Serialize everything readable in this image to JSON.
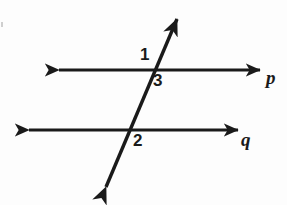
{
  "figure": {
    "background_color": "#fdfdfd",
    "stroke_color": "#1a1a1a",
    "stroke_width": 3,
    "width": 287,
    "height": 205
  },
  "lines": {
    "p": {
      "name": "p",
      "label": "p",
      "label_x": 266,
      "label_y": 68,
      "orientation": "horizontal",
      "y": 70,
      "x_start": 57,
      "x_end": 262,
      "arrows": "both"
    },
    "q": {
      "name": "q",
      "label": "q",
      "label_x": 241,
      "label_y": 130,
      "orientation": "horizontal",
      "y": 130,
      "x_start": 27,
      "x_end": 240,
      "arrows": "both"
    },
    "transversal": {
      "name": "transversal",
      "label": "",
      "x_start": 104,
      "y_start": 192,
      "x_end": 179,
      "y_end": 14,
      "arrows": "both"
    }
  },
  "intersections": {
    "p_transversal": {
      "x": 152,
      "y": 70
    },
    "q_transversal": {
      "x": 130,
      "y": 130
    }
  },
  "angle_labels": [
    {
      "id": "angle-1",
      "text": "1",
      "x": 140,
      "y": 46,
      "position": "above-left-of-p-intersection"
    },
    {
      "id": "angle-3",
      "text": "3",
      "x": 153,
      "y": 72,
      "position": "below-right-of-p-intersection"
    },
    {
      "id": "angle-2",
      "text": "2",
      "x": 133,
      "y": 132,
      "position": "below-right-of-q-intersection"
    }
  ]
}
